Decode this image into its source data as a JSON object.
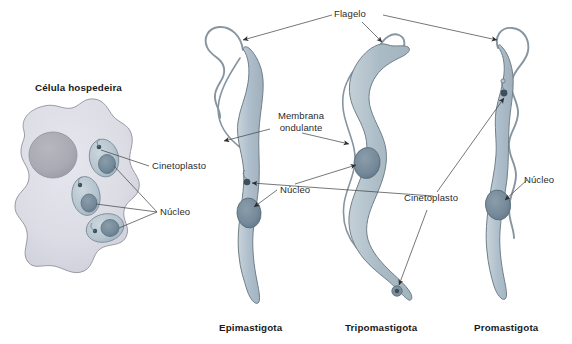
{
  "figure": {
    "title_host_cell": "Célula hospedeira",
    "labels": {
      "flagelo": "Flagelo",
      "membrana_ondulante_line1": "Membrana",
      "membrana_ondulante_line2": "ondulante",
      "cinetoplasto_host": "Cinetoplasto",
      "nucleo_host": "Núcleo",
      "nucleo_epi": "Núcleo",
      "cinetoplasto_epi": "Cinetoplasto",
      "cinetoplasto_tripo": "Cinetoplasto",
      "nucleo_tripo": "Núcleo",
      "nucleo_promasti": "Núcleo"
    },
    "forms": [
      {
        "name": "Epimastigota"
      },
      {
        "name": "Tripomastigota"
      },
      {
        "name": "Promastigota"
      }
    ],
    "colors": {
      "body_fill": "#b3c2cb",
      "body_fill_light": "#c6d2d9",
      "body_outline": "#6f7f88",
      "nucleus_fill": "#768c99",
      "nucleus_outline": "#5a6e7a",
      "kinetoplast_fill": "#3d4f5a",
      "host_cytoplasm": "#dcdce5",
      "host_outline": "#9a9aa6",
      "host_nucleus": "#abacb3",
      "amastigote_fill": "#b9c7d0",
      "flagellum_stroke": "#808e97",
      "leader_line": "#4a4a4a",
      "text": "#2b2b2b",
      "background": "#ffffff"
    }
  }
}
